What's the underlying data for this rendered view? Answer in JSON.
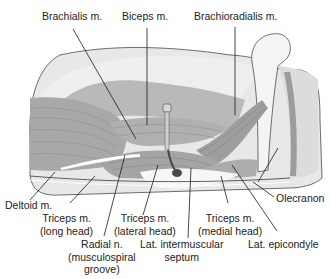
{
  "figure": {
    "colors": {
      "skin_light": "#e6e6e6",
      "skin_mid": "#d2d2d2",
      "muscle_dark": "#9a9a9a",
      "muscle_mid": "#b4b4b4",
      "bone": "#f2f2f2",
      "leader_line": "#1a1a1a",
      "text": "#222222"
    }
  },
  "labels": {
    "brachialis": {
      "line1": "Brachialis m."
    },
    "biceps": {
      "line1": "Biceps m."
    },
    "brachioradialis": {
      "line1": "Brachioradialis m."
    },
    "deltoid": {
      "line1": "Deltoid m."
    },
    "triceps_long": {
      "line1": "Triceps m.",
      "line2": "(long head)"
    },
    "triceps_lateral": {
      "line1": "Triceps m.",
      "line2": "(lateral head)"
    },
    "triceps_medial": {
      "line1": "Triceps m.",
      "line2": "(medial head)"
    },
    "radial_nerve": {
      "line1": "Radial n.",
      "line2": "(musculospiral",
      "line3": "groove)"
    },
    "lat_septum": {
      "line1": "Lat. intermuscular",
      "line2": "septum"
    },
    "olecranon": {
      "line1": "Olecranon"
    },
    "lat_epicondyle": {
      "line1": "Lat. epicondyle"
    }
  }
}
